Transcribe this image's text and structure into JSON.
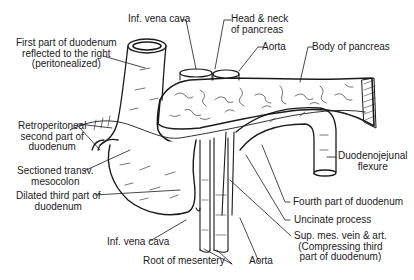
{
  "diagram": {
    "labels": {
      "inf_vena_cava_top": "Inf. vena cava",
      "head_neck_pancreas": "Head & neck\nof pancreas",
      "aorta_top": "Aorta",
      "body_pancreas": "Body of pancreas",
      "first_part": "First part of duodenum\nreflected to the right\n(peritonealized)",
      "retroperitoneal_second": "Retroperitoneal\nsecond part of\nduodenum",
      "sectioned_mesocolon": "Sectioned transv.\nmesocolon",
      "dilated_third": "Dilated third part of\nduodenum",
      "duodenojejunal": "Duodenojejunal\nflexure",
      "fourth_part": "Fourth part of duodenum",
      "uncinate": "Uncinate process",
      "sup_mes": "Sup. mes. vein & art.\n(Compressing third\npart of duodenum)",
      "inf_vena_cava_bottom": "Inf. vena cava",
      "root_mesentery": "Root of mesentery",
      "aorta_bottom": "Aorta"
    },
    "colors": {
      "ink": "#1a1a1a",
      "background": "#ffffff"
    }
  }
}
